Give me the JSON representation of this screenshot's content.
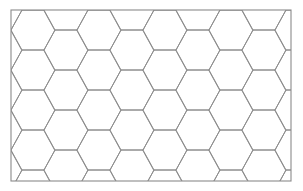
{
  "figure": {
    "name": "hexagonal-tiling",
    "title": "Honeycomb hexagonal tiling",
    "canvas": {
      "width": 303,
      "height": 191,
      "background_color": "#ffffff"
    },
    "frame": {
      "x": 11,
      "y": 10,
      "width": 280,
      "height": 171,
      "stroke_color": "#8a8a8a",
      "stroke_width": 1.1,
      "fill_color": "#ffffff"
    },
    "tiling": {
      "type": "hexagonal",
      "orientation": "flat-top",
      "hex_width": 44,
      "hex_height": 40,
      "column_pitch": 33,
      "row_pitch": 40,
      "column_offset": 20,
      "columns": 9,
      "rows": 5,
      "origin_x": 11,
      "origin_y": 10,
      "stroke_color": "#8e8e8e",
      "stroke_width": 1.0,
      "fill_color": "none"
    }
  },
  "chart_data": {
    "type": "diagram",
    "title": "Honeycomb hexagonal tiling",
    "xlabel": "",
    "ylabel": "",
    "legend": [],
    "annotations": [],
    "grid": false,
    "pattern": "regular hexagonal tessellation, flat-top hexagons in offset columns, clipped to a rectangular frame"
  }
}
